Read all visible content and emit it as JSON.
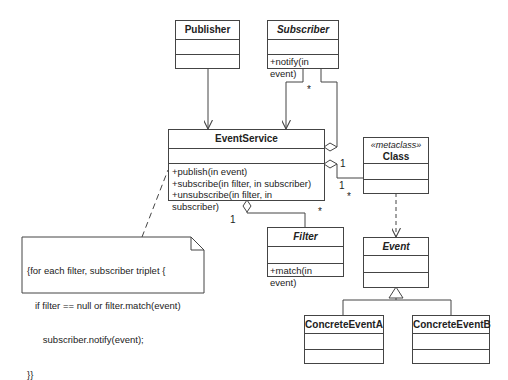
{
  "diagram": {
    "type": "UML class diagram",
    "classes": {
      "publisher": {
        "name": "Publisher",
        "operations": []
      },
      "subscriber": {
        "name": "Subscriber",
        "abstract": true,
        "operations": [
          "+notify(in event)"
        ]
      },
      "event_service": {
        "name": "EventService",
        "operations": [
          "+publish(in event)",
          "+subscribe(in filter, in subscriber)",
          "+unsubscribe(in filter, in subscriber)"
        ]
      },
      "class_meta": {
        "stereotype": "«metaclass»",
        "name": "Class"
      },
      "filter": {
        "name": "Filter",
        "abstract": true,
        "operations": [
          "+match(in event)"
        ]
      },
      "event": {
        "name": "Event",
        "abstract": true
      },
      "concrete_a": {
        "name": "ConcreteEventA"
      },
      "concrete_b": {
        "name": "ConcreteEventB"
      }
    },
    "note": {
      "lines": [
        "{for each filter, subscriber triplet {",
        "   if filter == null or filter.match(event)",
        "      subscriber.notify(event);",
        "}}"
      ]
    },
    "multiplicities": {
      "subscriber_star": "*",
      "class_one_a": "1",
      "class_one_b": "1",
      "class_star": "*",
      "filter_one": "1",
      "filter_star": "*"
    },
    "colors": {
      "line": "#444444",
      "background": "#ffffff"
    }
  }
}
